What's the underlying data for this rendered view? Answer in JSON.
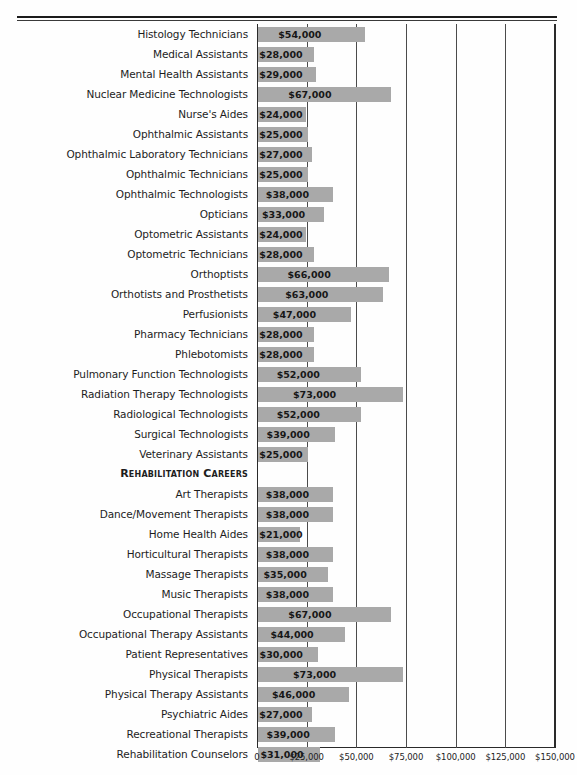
{
  "chart_data": {
    "type": "bar",
    "orientation": "horizontal",
    "title": "",
    "xlabel": "",
    "ylabel": "",
    "xlim": [
      0,
      150000
    ],
    "grid": true,
    "legend": null,
    "axis_ticks": [
      "0",
      "$25,000",
      "$50,000",
      "$75,000",
      "$100,000",
      "$125,000",
      "$150,000"
    ],
    "axis_tick_values": [
      0,
      25000,
      50000,
      75000,
      100000,
      125000,
      150000
    ],
    "categories": [
      "Histology Technicians",
      "Medical Assistants",
      "Mental Health Assistants",
      "Nuclear Medicine Technologists",
      "Nurse's Aides",
      "Ophthalmic Assistants",
      "Ophthalmic Laboratory Technicians",
      "Ophthalmic Technicians",
      "Ophthalmic Technologists",
      "Opticians",
      "Optometric Assistants",
      "Optometric Technicians",
      "Orthoptists",
      "Orthotists and Prosthetists",
      "Perfusionists",
      "Pharmacy Technicians",
      "Phlebotomists",
      "Pulmonary Function Technologists",
      "Radiation Therapy Technologists",
      "Radiological Technologists",
      "Surgical Technologists",
      "Veterinary Assistants",
      "Art Therapists",
      "Dance/Movement Therapists",
      "Home Health Aides",
      "Horticultural Therapists",
      "Massage Therapists",
      "Music Therapists",
      "Occupational Therapists",
      "Occupational Therapy Assistants",
      "Patient Representatives",
      "Physical Therapists",
      "Physical Therapy Assistants",
      "Psychiatric Aides",
      "Recreational Therapists",
      "Rehabilitation Counselors"
    ],
    "values": [
      54000,
      28000,
      29000,
      67000,
      24000,
      25000,
      27000,
      25000,
      38000,
      33000,
      24000,
      28000,
      66000,
      63000,
      47000,
      28000,
      28000,
      52000,
      73000,
      52000,
      39000,
      25000,
      38000,
      38000,
      21000,
      38000,
      35000,
      38000,
      67000,
      44000,
      30000,
      73000,
      46000,
      27000,
      39000,
      31000
    ],
    "value_labels": [
      "$54,000",
      "$28,000",
      "$29,000",
      "$67,000",
      "$24,000",
      "$25,000",
      "$27,000",
      "$25,000",
      "$38,000",
      "$33,000",
      "$24,000",
      "$28,000",
      "$66,000",
      "$63,000",
      "$47,000",
      "$28,000",
      "$28,000",
      "$52,000",
      "$73,000",
      "$52,000",
      "$39,000",
      "$25,000",
      "$38,000",
      "$38,000",
      "$21,000",
      "$38,000",
      "$35,000",
      "$38,000",
      "$67,000",
      "$44,000",
      "$30,000",
      "$73,000",
      "$46,000",
      "$27,000",
      "$39,000",
      "$31,000"
    ],
    "section_headings": [
      {
        "after_category": "Veterinary Assistants",
        "label": "Rehabilitation Careers"
      }
    ],
    "colors": {
      "bar": "#a9a9a9",
      "gridline": "#4b4b4b",
      "axis": "#2a2a2a",
      "text": "#1d1d1d",
      "background": "#fefefe"
    }
  },
  "rows": [
    {
      "label": "Histology Technicians",
      "value": 54000,
      "value_label": "$54,000",
      "kind": "bar"
    },
    {
      "label": "Medical Assistants",
      "value": 28000,
      "value_label": "$28,000",
      "kind": "bar"
    },
    {
      "label": "Mental Health Assistants",
      "value": 29000,
      "value_label": "$29,000",
      "kind": "bar"
    },
    {
      "label": "Nuclear Medicine Technologists",
      "value": 67000,
      "value_label": "$67,000",
      "kind": "bar"
    },
    {
      "label": "Nurse's Aides",
      "value": 24000,
      "value_label": "$24,000",
      "kind": "bar"
    },
    {
      "label": "Ophthalmic Assistants",
      "value": 25000,
      "value_label": "$25,000",
      "kind": "bar"
    },
    {
      "label": "Ophthalmic Laboratory Technicians",
      "value": 27000,
      "value_label": "$27,000",
      "kind": "bar"
    },
    {
      "label": "Ophthalmic Technicians",
      "value": 25000,
      "value_label": "$25,000",
      "kind": "bar"
    },
    {
      "label": "Ophthalmic Technologists",
      "value": 38000,
      "value_label": "$38,000",
      "kind": "bar"
    },
    {
      "label": "Opticians",
      "value": 33000,
      "value_label": "$33,000",
      "kind": "bar"
    },
    {
      "label": "Optometric Assistants",
      "value": 24000,
      "value_label": "$24,000",
      "kind": "bar"
    },
    {
      "label": "Optometric Technicians",
      "value": 28000,
      "value_label": "$28,000",
      "kind": "bar"
    },
    {
      "label": "Orthoptists",
      "value": 66000,
      "value_label": "$66,000",
      "kind": "bar"
    },
    {
      "label": "Orthotists and Prosthetists",
      "value": 63000,
      "value_label": "$63,000",
      "kind": "bar"
    },
    {
      "label": "Perfusionists",
      "value": 47000,
      "value_label": "$47,000",
      "kind": "bar"
    },
    {
      "label": "Pharmacy Technicians",
      "value": 28000,
      "value_label": "$28,000",
      "kind": "bar"
    },
    {
      "label": "Phlebotomists",
      "value": 28000,
      "value_label": "$28,000",
      "kind": "bar"
    },
    {
      "label": "Pulmonary Function Technologists",
      "value": 52000,
      "value_label": "$52,000",
      "kind": "bar"
    },
    {
      "label": "Radiation Therapy Technologists",
      "value": 73000,
      "value_label": "$73,000",
      "kind": "bar"
    },
    {
      "label": "Radiological Technologists",
      "value": 52000,
      "value_label": "$52,000",
      "kind": "bar"
    },
    {
      "label": "Surgical Technologists",
      "value": 39000,
      "value_label": "$39,000",
      "kind": "bar"
    },
    {
      "label": "Veterinary Assistants",
      "value": 25000,
      "value_label": "$25,000",
      "kind": "bar"
    },
    {
      "label": "Rehabilitation Careers",
      "value": null,
      "value_label": "",
      "kind": "section"
    },
    {
      "label": "Art Therapists",
      "value": 38000,
      "value_label": "$38,000",
      "kind": "bar"
    },
    {
      "label": "Dance/Movement Therapists",
      "value": 38000,
      "value_label": "$38,000",
      "kind": "bar"
    },
    {
      "label": "Home Health Aides",
      "value": 21000,
      "value_label": "$21,000",
      "kind": "bar"
    },
    {
      "label": "Horticultural Therapists",
      "value": 38000,
      "value_label": "$38,000",
      "kind": "bar"
    },
    {
      "label": "Massage Therapists",
      "value": 35000,
      "value_label": "$35,000",
      "kind": "bar"
    },
    {
      "label": "Music Therapists",
      "value": 38000,
      "value_label": "$38,000",
      "kind": "bar"
    },
    {
      "label": "Occupational Therapists",
      "value": 67000,
      "value_label": "$67,000",
      "kind": "bar"
    },
    {
      "label": "Occupational Therapy Assistants",
      "value": 44000,
      "value_label": "$44,000",
      "kind": "bar"
    },
    {
      "label": "Patient Representatives",
      "value": 30000,
      "value_label": "$30,000",
      "kind": "bar"
    },
    {
      "label": "Physical Therapists",
      "value": 73000,
      "value_label": "$73,000",
      "kind": "bar"
    },
    {
      "label": "Physical Therapy Assistants",
      "value": 46000,
      "value_label": "$46,000",
      "kind": "bar"
    },
    {
      "label": "Psychiatric Aides",
      "value": 27000,
      "value_label": "$27,000",
      "kind": "bar"
    },
    {
      "label": "Recreational Therapists",
      "value": 39000,
      "value_label": "$39,000",
      "kind": "bar"
    },
    {
      "label": "Rehabilitation Counselors",
      "value": 31000,
      "value_label": "$31,000",
      "kind": "bar"
    }
  ],
  "axis": {
    "ticks": [
      {
        "label": "0",
        "value": 0
      },
      {
        "label": "$25,000",
        "value": 25000
      },
      {
        "label": "$50,000",
        "value": 50000
      },
      {
        "label": "$75,000",
        "value": 75000
      },
      {
        "label": "$100,000",
        "value": 100000
      },
      {
        "label": "$125,000",
        "value": 125000
      },
      {
        "label": "$150,000",
        "value": 150000
      }
    ]
  }
}
